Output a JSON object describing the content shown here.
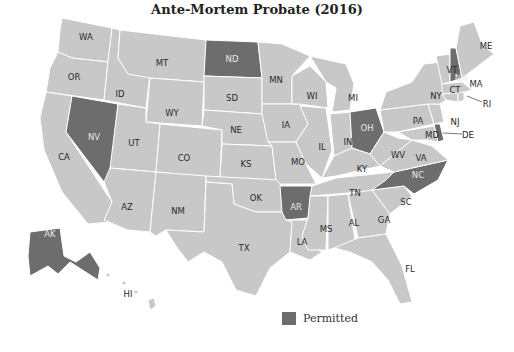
{
  "title": "Ante-Mortem Probate (2016)",
  "legend": {
    "label": "Permitted",
    "color": "#6d6d6d"
  },
  "colors": {
    "permitted": "#6d6d6d",
    "not_permitted": "#c8c8c8",
    "border": "#ffffff"
  },
  "permitted_states": [
    "ND",
    "NV",
    "OH",
    "NH",
    "DE",
    "AR",
    "NC",
    "AK"
  ],
  "states": {
    "WA": "WA",
    "OR": "OR",
    "CA": "CA",
    "ID": "ID",
    "NV": "NV",
    "MT": "MT",
    "WY": "WY",
    "UT": "UT",
    "AZ": "AZ",
    "CO": "CO",
    "NM": "NM",
    "ND": "ND",
    "SD": "SD",
    "NE": "NE",
    "KS": "KS",
    "OK": "OK",
    "TX": "TX",
    "MN": "MN",
    "IA": "IA",
    "MO": "MO",
    "AR": "AR",
    "LA": "LA",
    "WI": "WI",
    "IL": "IL",
    "MI": "MI",
    "IN": "IN",
    "OH": "OH",
    "KY": "KY",
    "TN": "TN",
    "MS": "MS",
    "AL": "AL",
    "GA": "GA",
    "FL": "FL",
    "SC": "SC",
    "NC": "NC",
    "VA": "VA",
    "WV": "WV",
    "PA": "PA",
    "NY": "NY",
    "VT": "VT",
    "NH": "NH",
    "ME": "ME",
    "MA": "MA",
    "RI": "RI",
    "CT": "CT",
    "NJ": "NJ",
    "DE": "DE",
    "MD": "MD",
    "AK": "AK",
    "HI": "HI"
  }
}
